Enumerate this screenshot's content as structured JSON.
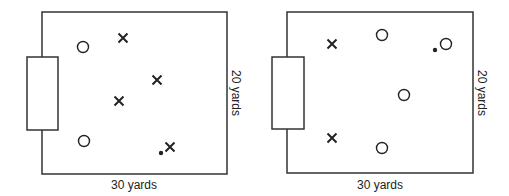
{
  "diagrams": [
    {
      "name": "left-field",
      "width_label": "30 yards",
      "height_label": "20 yards",
      "field": {
        "x": 42,
        "y": 12,
        "w": 185,
        "h": 162
      },
      "goal": {
        "x": 27,
        "y": 57,
        "w": 31,
        "h": 73
      },
      "markers": [
        {
          "type": "circle",
          "x": 83,
          "y": 47
        },
        {
          "type": "x",
          "x": 123,
          "y": 38
        },
        {
          "type": "x",
          "x": 157,
          "y": 80
        },
        {
          "type": "x",
          "x": 119,
          "y": 101
        },
        {
          "type": "circle",
          "x": 84,
          "y": 141
        },
        {
          "type": "ball",
          "x": 161,
          "y": 153
        },
        {
          "type": "x",
          "x": 170,
          "y": 147
        }
      ]
    },
    {
      "name": "right-field",
      "width_label": "30 yards",
      "height_label": "20 yards",
      "field": {
        "x": 287,
        "y": 12,
        "w": 186,
        "h": 161
      },
      "goal": {
        "x": 272,
        "y": 57,
        "w": 32,
        "h": 72
      },
      "markers": [
        {
          "type": "x",
          "x": 332,
          "y": 44
        },
        {
          "type": "circle",
          "x": 382,
          "y": 35
        },
        {
          "type": "ball",
          "x": 435,
          "y": 50
        },
        {
          "type": "circle",
          "x": 446,
          "y": 44
        },
        {
          "type": "circle",
          "x": 404,
          "y": 95
        },
        {
          "type": "x",
          "x": 332,
          "y": 138
        },
        {
          "type": "circle",
          "x": 382,
          "y": 148
        }
      ]
    }
  ],
  "colors": {
    "line": "#333333",
    "marker": "#222222",
    "background": "#ffffff"
  }
}
